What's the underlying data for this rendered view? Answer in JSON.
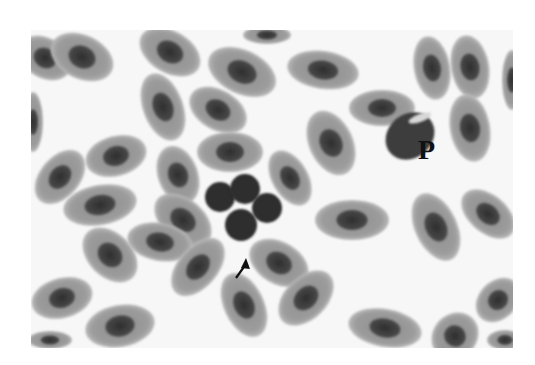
{
  "figure": {
    "colors": {
      "background": "#f7f7f7",
      "cytoplasm": "#9a9a9a",
      "cytoplasm_edge": "#b5b5b5",
      "nucleus": "#3a3a3a",
      "cluster_cell": "#2e2e2e",
      "label": "#111111"
    },
    "labels": [
      {
        "text": "P",
        "x": 418,
        "y": 158
      }
    ],
    "arrow": {
      "x1": 236,
      "y1": 278,
      "x2": 246,
      "y2": 258
    },
    "cells": [
      {
        "cx": 45,
        "cy": 58,
        "rx": 28,
        "ry": 20,
        "rot": 30
      },
      {
        "cx": 82,
        "cy": 57,
        "rx": 33,
        "ry": 22,
        "rot": 25
      },
      {
        "cx": 170,
        "cy": 52,
        "rx": 33,
        "ry": 21,
        "rot": 30
      },
      {
        "cx": 267,
        "cy": 35,
        "rx": 24,
        "ry": 9,
        "rot": 0
      },
      {
        "cx": 242,
        "cy": 72,
        "rx": 36,
        "ry": 22,
        "rot": 25
      },
      {
        "cx": 323,
        "cy": 70,
        "rx": 36,
        "ry": 19,
        "rot": 8
      },
      {
        "cx": 432,
        "cy": 68,
        "rx": 32,
        "ry": 18,
        "rot": 80
      },
      {
        "cx": 470,
        "cy": 67,
        "rx": 32,
        "ry": 19,
        "rot": 80
      },
      {
        "cx": 512,
        "cy": 80,
        "rx": 30,
        "ry": 10,
        "rot": 90
      },
      {
        "cx": 163,
        "cy": 107,
        "rx": 35,
        "ry": 20,
        "rot": 70
      },
      {
        "cx": 218,
        "cy": 110,
        "rx": 31,
        "ry": 20,
        "rot": 30
      },
      {
        "cx": 382,
        "cy": 108,
        "rx": 33,
        "ry": 18,
        "rot": 0
      },
      {
        "cx": 33,
        "cy": 122,
        "rx": 30,
        "ry": 10,
        "rot": 90
      },
      {
        "cx": 331,
        "cy": 143,
        "rx": 34,
        "ry": 22,
        "rot": 65
      },
      {
        "cx": 470,
        "cy": 128,
        "rx": 34,
        "ry": 20,
        "rot": 80
      },
      {
        "cx": 116,
        "cy": 156,
        "rx": 31,
        "ry": 20,
        "rot": -15
      },
      {
        "cx": 230,
        "cy": 152,
        "rx": 33,
        "ry": 20,
        "rot": 0
      },
      {
        "cx": 60,
        "cy": 177,
        "rx": 31,
        "ry": 20,
        "rot": -50
      },
      {
        "cx": 178,
        "cy": 175,
        "rx": 30,
        "ry": 20,
        "rot": 70
      },
      {
        "cx": 290,
        "cy": 178,
        "rx": 30,
        "ry": 18,
        "rot": 60
      },
      {
        "cx": 100,
        "cy": 205,
        "rx": 37,
        "ry": 20,
        "rot": -10
      },
      {
        "cx": 183,
        "cy": 220,
        "rx": 33,
        "ry": 21,
        "rot": 40
      },
      {
        "cx": 352,
        "cy": 220,
        "rx": 37,
        "ry": 20,
        "rot": 0
      },
      {
        "cx": 160,
        "cy": 242,
        "rx": 33,
        "ry": 19,
        "rot": 10
      },
      {
        "cx": 436,
        "cy": 227,
        "rx": 36,
        "ry": 21,
        "rot": 65
      },
      {
        "cx": 488,
        "cy": 214,
        "rx": 31,
        "ry": 19,
        "rot": 40
      },
      {
        "cx": 110,
        "cy": 255,
        "rx": 32,
        "ry": 22,
        "rot": 45
      },
      {
        "cx": 198,
        "cy": 267,
        "rx": 34,
        "ry": 20,
        "rot": -50
      },
      {
        "cx": 279,
        "cy": 263,
        "rx": 32,
        "ry": 21,
        "rot": 30
      },
      {
        "cx": 306,
        "cy": 298,
        "rx": 33,
        "ry": 21,
        "rot": -45
      },
      {
        "cx": 62,
        "cy": 298,
        "rx": 31,
        "ry": 20,
        "rot": -15
      },
      {
        "cx": 244,
        "cy": 305,
        "rx": 34,
        "ry": 20,
        "rot": 65
      },
      {
        "cx": 120,
        "cy": 326,
        "rx": 35,
        "ry": 21,
        "rot": -10
      },
      {
        "cx": 385,
        "cy": 328,
        "rx": 37,
        "ry": 19,
        "rot": 10
      },
      {
        "cx": 455,
        "cy": 336,
        "rx": 25,
        "ry": 22,
        "rot": -45
      },
      {
        "cx": 498,
        "cy": 300,
        "rx": 25,
        "ry": 19,
        "rot": -45
      },
      {
        "cx": 505,
        "cy": 340,
        "rx": 18,
        "ry": 10,
        "rot": 0
      },
      {
        "cx": 50,
        "cy": 340,
        "rx": 22,
        "ry": 9,
        "rot": 0
      }
    ],
    "cluster": [
      {
        "cx": 220,
        "cy": 197,
        "r": 15
      },
      {
        "cx": 245,
        "cy": 189,
        "r": 15
      },
      {
        "cx": 267,
        "cy": 208,
        "r": 15
      },
      {
        "cx": 241,
        "cy": 225,
        "r": 16
      }
    ],
    "p_cell": {
      "cx": 410,
      "cy": 136,
      "rx": 26,
      "ry": 22,
      "rot": -40
    }
  }
}
